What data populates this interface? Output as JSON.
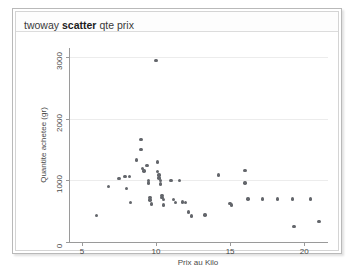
{
  "window": {
    "command_line": {
      "prefix": "twoway",
      "command": "scatter",
      "args": "qte prix"
    }
  },
  "chart_data": {
    "type": "scatter",
    "title": "",
    "xlabel": "Prix au Kilo",
    "ylabel": "Quantite achetee (gr)",
    "xlim": [
      4.2,
      21.6
    ],
    "ylim": [
      0,
      3150
    ],
    "xticks": [
      5,
      10,
      15,
      20
    ],
    "yticks": [
      0,
      1000,
      2000,
      3000
    ],
    "grid": "horizontal",
    "marker_color": "#63666b",
    "legend": "none",
    "points": [
      [
        6.0,
        430
      ],
      [
        6.8,
        900
      ],
      [
        7.5,
        1030
      ],
      [
        7.9,
        1060
      ],
      [
        8.2,
        1060
      ],
      [
        8.0,
        870
      ],
      [
        8.3,
        640
      ],
      [
        8.7,
        1330
      ],
      [
        9.0,
        1660
      ],
      [
        9.0,
        1500
      ],
      [
        9.1,
        1190
      ],
      [
        9.2,
        1150
      ],
      [
        9.4,
        1240
      ],
      [
        9.5,
        1000
      ],
      [
        9.5,
        960
      ],
      [
        9.6,
        720
      ],
      [
        9.6,
        680
      ],
      [
        9.7,
        620
      ],
      [
        10.0,
        2950
      ],
      [
        10.1,
        1300
      ],
      [
        10.1,
        1140
      ],
      [
        10.2,
        1090
      ],
      [
        10.2,
        1040
      ],
      [
        10.3,
        1000
      ],
      [
        10.3,
        940
      ],
      [
        10.4,
        760
      ],
      [
        10.4,
        720
      ],
      [
        10.5,
        690
      ],
      [
        10.5,
        600
      ],
      [
        11.0,
        1000
      ],
      [
        11.2,
        690
      ],
      [
        11.3,
        640
      ],
      [
        11.6,
        1000
      ],
      [
        11.8,
        650
      ],
      [
        12.0,
        640
      ],
      [
        12.2,
        490
      ],
      [
        12.4,
        420
      ],
      [
        13.3,
        440
      ],
      [
        14.2,
        1090
      ],
      [
        15.0,
        630
      ],
      [
        15.1,
        600
      ],
      [
        16.0,
        1160
      ],
      [
        16.0,
        960
      ],
      [
        16.2,
        700
      ],
      [
        17.2,
        700
      ],
      [
        18.2,
        700
      ],
      [
        19.2,
        700
      ],
      [
        19.3,
        250
      ],
      [
        20.4,
        700
      ],
      [
        21.0,
        330
      ]
    ]
  }
}
